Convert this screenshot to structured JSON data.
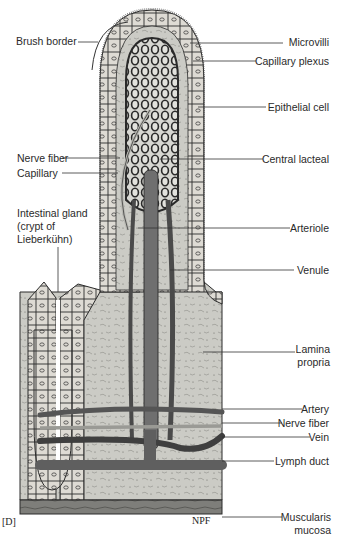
{
  "figure": {
    "panel_label": "[D]",
    "signature": "NPF",
    "colors": {
      "background": "#ffffff",
      "lamina_propria": "#c9c9c3",
      "epithelium": "#dcdcd6",
      "cell_outline": "#2b2b2b",
      "capillary": "#3a3a3a",
      "lacteal": "#6f6f6f",
      "muscularis": "#7c7c78",
      "label_text": "#2a2a2a"
    }
  },
  "labels": {
    "left": [
      {
        "id": "brush-border",
        "text": "Brush border"
      },
      {
        "id": "nerve-fiber-upper",
        "text": "Nerve fiber"
      },
      {
        "id": "capillary",
        "text": "Capillary"
      },
      {
        "id": "intestinal-gland-1",
        "text": "Intestinal gland"
      },
      {
        "id": "intestinal-gland-2",
        "text": "(crypt of"
      },
      {
        "id": "intestinal-gland-3",
        "text": "Lieberkühn)"
      }
    ],
    "right": [
      {
        "id": "microvilli",
        "text": "Microvilli"
      },
      {
        "id": "capillary-plexus",
        "text": "Capillary plexus"
      },
      {
        "id": "epithelial-cell",
        "text": "Epithelial cell"
      },
      {
        "id": "central-lacteal",
        "text": "Central lacteal"
      },
      {
        "id": "arteriole",
        "text": "Arteriole"
      },
      {
        "id": "venule",
        "text": "Venule"
      },
      {
        "id": "lamina-propria-1",
        "text": "Lamina"
      },
      {
        "id": "lamina-propria-2",
        "text": "propria"
      },
      {
        "id": "artery",
        "text": "Artery"
      },
      {
        "id": "nerve-fiber-lower",
        "text": "Nerve fiber"
      },
      {
        "id": "vein",
        "text": "Vein"
      },
      {
        "id": "lymph-duct",
        "text": "Lymph duct"
      },
      {
        "id": "muscularis-mucosa-1",
        "text": "Muscularis"
      },
      {
        "id": "muscularis-mucosa-2",
        "text": "mucosa"
      }
    ]
  }
}
